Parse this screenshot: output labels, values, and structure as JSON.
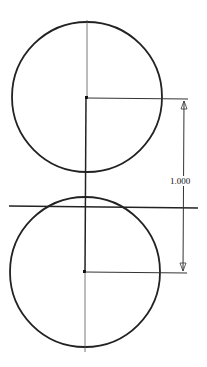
{
  "diagram": {
    "type": "cad-sketch",
    "dimension": {
      "label": "1.000",
      "orientation": "vertical"
    },
    "circles": [
      {
        "name": "top-circle",
        "cx": 86,
        "cy": 97,
        "r": 75
      },
      {
        "name": "bottom-circle",
        "cx": 84,
        "cy": 272,
        "r": 75
      }
    ],
    "lines": {
      "horizontal_reference": {
        "x1": 9,
        "y1": 206,
        "x2": 198,
        "y2": 208
      },
      "vertical_centerline": {
        "x1": 87,
        "y1": 20,
        "x2": 84,
        "y2": 352
      }
    },
    "colors": {
      "stroke": "#222222",
      "background": "#ffffff"
    }
  }
}
